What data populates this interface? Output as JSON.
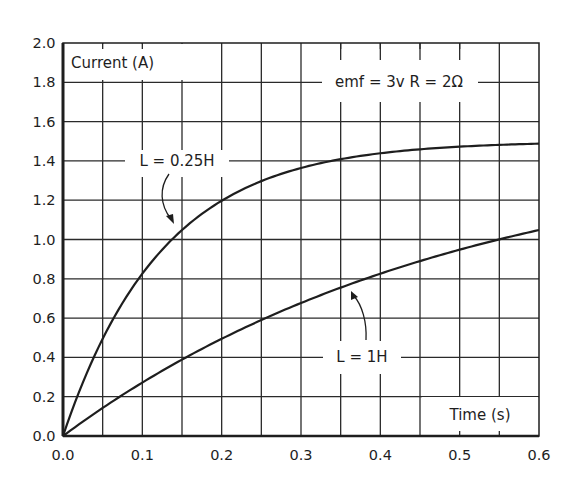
{
  "chart_data": {
    "type": "line",
    "title": "",
    "xlabel": "Time (s)",
    "ylabel": "Current (A)",
    "xlim": [
      0.0,
      0.6
    ],
    "ylim": [
      0.0,
      2.0
    ],
    "grid": true,
    "x_ticks": [
      "0.0",
      "0.1",
      "0.2",
      "0.3",
      "0.4",
      "0.5",
      "0.6"
    ],
    "y_ticks": [
      "0.0",
      "0.2",
      "0.4",
      "0.6",
      "0.8",
      "1.0",
      "1.2",
      "1.4",
      "1.6",
      "1.8",
      "2.0"
    ],
    "annotations": [
      "emf = 3v  R = 2Ω",
      "L = 0.25H",
      "L = 1H"
    ],
    "x": [
      0.0,
      0.05,
      0.1,
      0.15,
      0.2,
      0.25,
      0.3,
      0.35,
      0.4,
      0.45,
      0.5,
      0.55,
      0.6
    ],
    "series": [
      {
        "name": "L = 0.25H",
        "values": [
          0.0,
          0.49,
          0.83,
          1.05,
          1.2,
          1.3,
          1.36,
          1.41,
          1.44,
          1.46,
          1.47,
          1.48,
          1.49
        ]
      },
      {
        "name": "L = 1H",
        "values": [
          0.0,
          0.14,
          0.27,
          0.39,
          0.49,
          0.59,
          0.68,
          0.75,
          0.83,
          0.89,
          0.95,
          1.0,
          1.05
        ]
      }
    ],
    "parameters": {
      "emf": "3v",
      "R": "2Ω"
    }
  },
  "labels": {
    "y_axis": "Current (A)",
    "x_axis": "Time (s)",
    "params": "emf = 3v  R = 2Ω",
    "curve_fast": "L = 0.25H",
    "curve_slow": "L = 1H"
  }
}
